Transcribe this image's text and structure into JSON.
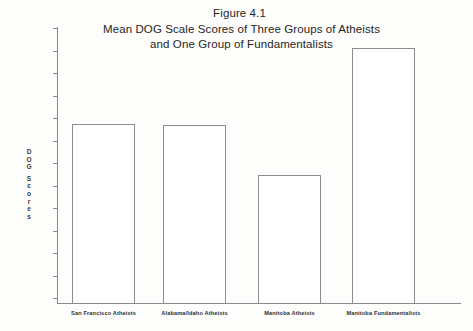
{
  "figure": {
    "title_lines": [
      "Figure 4.1",
      "Mean DOG Scale Scores of Three Groups of Atheists",
      "and One Group of Fundamentalists"
    ],
    "y_axis_caption_letters": [
      "D",
      "O",
      "G",
      "S",
      "c",
      "o",
      "r",
      "e",
      "s"
    ]
  },
  "chart_data": {
    "type": "bar",
    "xlabel": "",
    "ylabel": "DOG Scores",
    "categories": [
      "San Francisco Atheists",
      "Alabama/Idaho Atheists",
      "Manitoba Atheists",
      "Manitoba Fundamentalists"
    ],
    "values": [
      87.5,
      87,
      64.5,
      121
    ],
    "ylim": [
      0,
      130
    ],
    "yticks": [
      10,
      20,
      30,
      40,
      50,
      60,
      70,
      80,
      90,
      100,
      110,
      120,
      130
    ],
    "ytick_labels": [
      "10",
      "20",
      "30",
      "40",
      "50",
      "60",
      "70",
      "80",
      "90",
      "100",
      "110",
      "120",
      "130"
    ],
    "grid": false,
    "legend": null,
    "series": [
      {
        "name": "Mean DOG Scale Score",
        "values": [
          87.5,
          87,
          64.5,
          121
        ]
      }
    ],
    "bar_style": {
      "fill": "#ffffff",
      "edge": "#8d8d8d"
    }
  },
  "colors": {
    "background": "#fdfdfc",
    "axis": "#8a8a8a",
    "text": "#262626"
  }
}
